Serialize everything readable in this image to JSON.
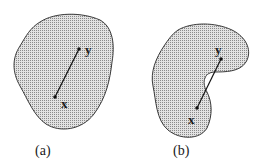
{
  "figure": {
    "panels": [
      {
        "id": "a",
        "caption": "(a)",
        "description": "convex set",
        "points": {
          "y": {
            "label": "y"
          },
          "x": {
            "label": "x"
          }
        }
      },
      {
        "id": "b",
        "caption": "(b)",
        "description": "non-convex set",
        "points": {
          "y": {
            "label": "y"
          },
          "x": {
            "label": "x"
          }
        }
      }
    ],
    "colors": {
      "fill": "#c8c8c8",
      "stroke": "#3a3a3a",
      "segment": "#111111"
    }
  }
}
